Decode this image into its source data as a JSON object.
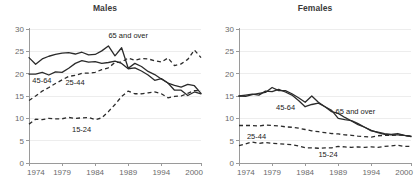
{
  "figure": {
    "panels": [
      {
        "key": "males",
        "title": "Males"
      },
      {
        "key": "females",
        "title": "Females"
      }
    ]
  },
  "chart_data": [
    {
      "type": "line",
      "title": "Males",
      "xlabel": "",
      "ylabel": "",
      "xlim": [
        1974,
        2000
      ],
      "ylim": [
        0,
        30
      ],
      "xticks": [
        1974,
        1979,
        1984,
        1989,
        1994,
        2000
      ],
      "yticks": [
        0,
        5,
        10,
        15,
        20,
        25,
        30
      ],
      "grid": true,
      "legend": "inline-annotations",
      "x": [
        1974,
        1975,
        1976,
        1977,
        1978,
        1979,
        1980,
        1981,
        1982,
        1983,
        1984,
        1985,
        1986,
        1987,
        1988,
        1989,
        1990,
        1991,
        1992,
        1993,
        1994,
        1995,
        1996,
        1997,
        1998,
        1999,
        2000
      ],
      "series": [
        {
          "name": "65 and over",
          "style": "solid",
          "label_text": "65 and over",
          "values": [
            23.6,
            22.1,
            23.3,
            23.9,
            24.3,
            24.6,
            24.7,
            24.4,
            24.8,
            24.2,
            24.3,
            25.1,
            26.2,
            24.0,
            25.8,
            21.2,
            22.3,
            21.6,
            20.5,
            19.8,
            18.8,
            17.9,
            17.4,
            17.0,
            17.6,
            17.3,
            15.6
          ]
        },
        {
          "name": "45-64",
          "style": "solid",
          "label_text": "45-64",
          "values": [
            19.9,
            19.9,
            20.3,
            19.7,
            20.4,
            20.3,
            21.2,
            22.3,
            22.9,
            22.6,
            22.7,
            22.3,
            22.5,
            22.8,
            22.3,
            21.1,
            21.3,
            20.6,
            19.7,
            18.5,
            18.9,
            17.9,
            16.3,
            16.3,
            15.1,
            15.9,
            15.5
          ]
        },
        {
          "name": "25-44",
          "style": "dashed",
          "label_text": "25-44",
          "values": [
            14.0,
            15.0,
            16.1,
            16.9,
            17.8,
            18.6,
            19.4,
            19.6,
            20.1,
            20.1,
            20.3,
            20.9,
            21.3,
            22.5,
            22.6,
            23.5,
            23.0,
            23.4,
            23.3,
            22.9,
            22.6,
            23.5,
            21.8,
            22.2,
            23.2,
            25.3,
            23.6
          ]
        },
        {
          "name": "15-24",
          "style": "dashed",
          "label_text": "15-24",
          "values": [
            8.7,
            9.8,
            9.7,
            10.0,
            9.9,
            9.9,
            10.2,
            10.0,
            10.1,
            10.2,
            9.7,
            10.1,
            11.5,
            13.1,
            14.9,
            16.1,
            15.5,
            15.5,
            15.7,
            15.9,
            15.5,
            14.6,
            14.9,
            15.0,
            15.6,
            16.2,
            16.2
          ]
        }
      ],
      "annotations": [
        {
          "text": "65 and over",
          "x": 1986,
          "y": 28.0
        },
        {
          "text": "45-64",
          "x": 1974.5,
          "y": 17.8
        },
        {
          "text": "25-44",
          "x": 1979.5,
          "y": 17.5
        },
        {
          "text": "15-24",
          "x": 1980.5,
          "y": 7.0
        }
      ]
    },
    {
      "type": "line",
      "title": "Females",
      "xlabel": "",
      "ylabel": "",
      "xlim": [
        1974,
        2000
      ],
      "ylim": [
        0,
        30
      ],
      "xticks": [
        1974,
        1979,
        1984,
        1989,
        1994,
        2000
      ],
      "yticks": [
        0,
        5,
        10,
        15,
        20,
        25,
        30
      ],
      "grid": true,
      "legend": "inline-annotations",
      "x": [
        1974,
        1975,
        1976,
        1977,
        1978,
        1979,
        1980,
        1981,
        1982,
        1983,
        1984,
        1985,
        1986,
        1987,
        1988,
        1989,
        1990,
        1991,
        1992,
        1993,
        1994,
        1995,
        1996,
        1997,
        1998,
        1999,
        2000
      ],
      "series": [
        {
          "name": "45-64",
          "style": "solid",
          "label_text": "45-64",
          "values": [
            15.0,
            14.9,
            15.3,
            15.6,
            15.8,
            16.9,
            16.2,
            16.2,
            15.5,
            14.6,
            13.6,
            15.0,
            13.6,
            12.6,
            11.5,
            11.1,
            10.2,
            9.4,
            8.6,
            8.0,
            7.3,
            6.8,
            6.4,
            6.3,
            6.3,
            6.2,
            5.9
          ]
        },
        {
          "name": "65 and over",
          "style": "solid",
          "label_text": "65 and over",
          "values": [
            15.0,
            15.2,
            15.4,
            15.2,
            16.1,
            16.0,
            16.5,
            15.9,
            15.2,
            14.0,
            12.6,
            13.1,
            13.4,
            12.6,
            11.8,
            10.0,
            9.7,
            9.5,
            8.8,
            8.0,
            7.2,
            6.9,
            6.6,
            6.4,
            6.6,
            6.2,
            6.0
          ]
        },
        {
          "name": "25-44",
          "style": "dashed",
          "label_text": "25-44",
          "values": [
            8.4,
            8.4,
            8.4,
            8.3,
            8.5,
            8.4,
            8.3,
            8.1,
            8.0,
            7.8,
            7.5,
            7.2,
            7.0,
            6.8,
            6.6,
            6.5,
            6.3,
            6.2,
            6.0,
            5.9,
            5.8,
            6.1,
            6.2,
            6.2,
            6.3,
            6.2,
            6.0
          ]
        },
        {
          "name": "15-24",
          "style": "dashed",
          "label_text": "15-24",
          "values": [
            3.9,
            4.3,
            4.7,
            4.4,
            4.6,
            4.4,
            4.3,
            4.2,
            4.1,
            3.8,
            3.4,
            3.4,
            3.3,
            3.4,
            3.4,
            3.7,
            3.6,
            3.5,
            3.6,
            3.5,
            3.6,
            3.5,
            3.7,
            3.8,
            4.0,
            3.7,
            3.7
          ]
        }
      ],
      "annotations": [
        {
          "text": "45-64",
          "x": 1979.6,
          "y": 11.8
        },
        {
          "text": "65 and over",
          "x": 1988.6,
          "y": 11.0
        },
        {
          "text": "25-44",
          "x": 1975.2,
          "y": 5.3
        },
        {
          "text": "15-24",
          "x": 1986.0,
          "y": 1.3
        }
      ]
    }
  ]
}
